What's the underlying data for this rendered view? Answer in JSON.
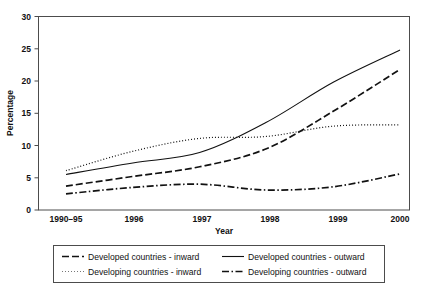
{
  "chart_data": {
    "type": "line",
    "title": "",
    "subtitle": "",
    "xlabel": "Year",
    "ylabel": "Percentage",
    "x": [
      "1990–95",
      "1996",
      "1997",
      "1998",
      "1999",
      "2000"
    ],
    "categories": [
      "1990–95",
      "1996",
      "1997",
      "1998",
      "1999",
      "2000"
    ],
    "xlim": [
      0,
      5
    ],
    "ylim": [
      0,
      30
    ],
    "yticks": [
      0,
      5,
      10,
      15,
      20,
      25,
      30
    ],
    "ytick_labels": [
      "0",
      "5",
      "10",
      "15",
      "20",
      "25",
      "30"
    ],
    "grid": false,
    "legend_position": "bottom",
    "series": [
      {
        "name": "Developed countries - inward",
        "style": "dashed",
        "color": "#111111",
        "values": [
          3.7,
          5.2,
          6.7,
          9.5,
          15.3,
          21.8
        ]
      },
      {
        "name": "Developed countries - outward",
        "style": "solid",
        "color": "#111111",
        "values": [
          5.5,
          7.3,
          8.9,
          13.6,
          19.8,
          24.8
        ]
      },
      {
        "name": "Developing countries - inward",
        "style": "dotted",
        "color": "#111111",
        "values": [
          6.1,
          9.1,
          11.1,
          11.4,
          13.0,
          13.2
        ]
      },
      {
        "name": "Developing countries - outward",
        "style": "dashdot",
        "color": "#111111",
        "values": [
          2.5,
          3.5,
          4.0,
          3.1,
          3.6,
          5.6
        ]
      }
    ]
  },
  "axes": {
    "ylabel": "Percentage",
    "xlabel": "Year",
    "ytick_labels": [
      "30",
      "25",
      "20",
      "15",
      "10",
      "5",
      "0"
    ],
    "xtick_labels": [
      "1990–95",
      "1996",
      "1997",
      "1998",
      "1999",
      "2000"
    ]
  },
  "legend": {
    "entries": [
      {
        "label": "Developed countries - inward",
        "style": "dashed"
      },
      {
        "label": "Developed countries - outward",
        "style": "solid"
      },
      {
        "label": "Developing countries - inward",
        "style": "dotted"
      },
      {
        "label": "Developing countries - outward",
        "style": "dashdot"
      }
    ]
  }
}
